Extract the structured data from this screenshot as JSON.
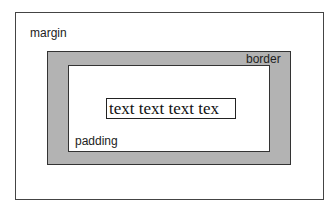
{
  "diagram": {
    "labels": {
      "margin": "margin",
      "border": "border",
      "padding": "padding"
    },
    "content_text": "text text text tex",
    "colors": {
      "border_fill": "#b3b3b3",
      "background": "#ffffff",
      "stroke": "#333333"
    }
  }
}
